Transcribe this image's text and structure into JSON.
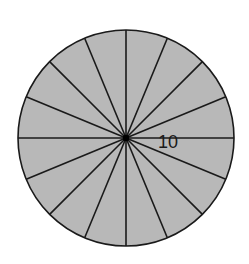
{
  "diagram": {
    "type": "circle-divided-into-sectors",
    "sector_count": 16,
    "center": {
      "x": 126,
      "y": 138
    },
    "radius": 108,
    "fill_color": "#b8b8b8",
    "stroke_color": "#1a1a1a",
    "center_dot_color": "#000000",
    "radius_label": "10"
  }
}
